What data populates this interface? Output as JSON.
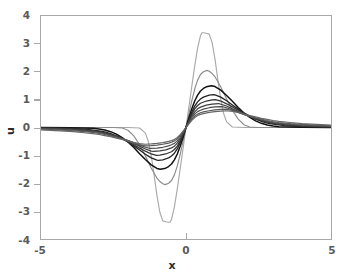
{
  "chart_data": {
    "type": "line",
    "title": "",
    "xlabel": "x",
    "ylabel": "u",
    "xlim": [
      -5,
      5
    ],
    "ylim": [
      -4,
      4
    ],
    "xticks": [
      -5,
      0,
      5
    ],
    "xticklabels": [
      "-5",
      "0",
      "5"
    ],
    "yticks": [
      -4,
      -3,
      -2,
      -1,
      0,
      1,
      2,
      3,
      4
    ],
    "yticklabels": [
      "-4",
      "-3",
      "-2",
      "-1",
      "0",
      "1",
      "2",
      "3",
      "4"
    ],
    "grid": false,
    "legend": false,
    "series": [
      {
        "name": "curve-1",
        "color": "#a9a9a9",
        "amplitude": 3.4,
        "peak_x": 0.55,
        "trough_x": -0.55,
        "half_width": 0.42,
        "support": 1.35,
        "linewidth": 1.15,
        "x": [
          -5.0,
          -4.5,
          -4.0,
          -3.5,
          -3.0,
          -2.5,
          -2.0,
          -1.6,
          -1.4,
          -1.3,
          -1.2,
          -1.1,
          -1.0,
          -0.9,
          -0.8,
          -0.7,
          -0.6,
          -0.55,
          -0.5,
          -0.4,
          -0.3,
          -0.2,
          -0.1,
          0.0,
          0.1,
          0.2,
          0.3,
          0.4,
          0.5,
          0.55,
          0.6,
          0.7,
          0.8,
          0.9,
          1.0,
          1.1,
          1.2,
          1.3,
          1.4,
          1.6,
          2.0,
          2.5,
          3.0,
          3.5,
          4.0,
          4.5,
          5.0
        ],
        "y": [
          0.0,
          0.0,
          0.0,
          0.0,
          0.0,
          0.0,
          0.0,
          -0.02,
          -0.2,
          -0.5,
          -1.0,
          -1.7,
          -2.45,
          -3.05,
          -3.35,
          -3.38,
          -3.4,
          -3.4,
          -3.3,
          -2.85,
          -2.2,
          -1.48,
          -0.74,
          0.0,
          0.74,
          1.48,
          2.2,
          2.85,
          3.3,
          3.4,
          3.4,
          3.38,
          3.35,
          3.05,
          2.45,
          1.7,
          1.0,
          0.5,
          0.2,
          0.02,
          0.0,
          0.0,
          0.0,
          0.0,
          0.0,
          0.0,
          0.0
        ]
      },
      {
        "name": "curve-2",
        "color": "#8c8c8c",
        "amplitude": 2.05,
        "peak_x": 0.72,
        "trough_x": -0.72,
        "half_width": 0.6,
        "support": 1.8,
        "linewidth": 1.15,
        "x": [
          -5.0,
          -4.0,
          -3.0,
          -2.5,
          -2.2,
          -2.0,
          -1.8,
          -1.6,
          -1.4,
          -1.2,
          -1.0,
          -0.9,
          -0.8,
          -0.72,
          -0.6,
          -0.5,
          -0.4,
          -0.3,
          -0.2,
          -0.1,
          0.0,
          0.1,
          0.2,
          0.3,
          0.4,
          0.5,
          0.6,
          0.72,
          0.8,
          0.9,
          1.0,
          1.2,
          1.4,
          1.6,
          1.8,
          2.0,
          2.2,
          2.5,
          3.0,
          4.0,
          5.0
        ],
        "y": [
          0.0,
          0.0,
          0.0,
          0.0,
          -0.02,
          -0.1,
          -0.3,
          -0.62,
          -1.02,
          -1.45,
          -1.82,
          -1.94,
          -2.02,
          -2.05,
          -2.0,
          -1.9,
          -1.7,
          -1.38,
          -0.96,
          -0.49,
          0.0,
          0.49,
          0.96,
          1.38,
          1.7,
          1.9,
          2.0,
          2.05,
          2.02,
          1.94,
          1.82,
          1.45,
          1.02,
          0.62,
          0.3,
          0.1,
          0.02,
          0.0,
          0.0,
          0.0,
          0.0
        ]
      },
      {
        "name": "curve-3",
        "color": "#111111",
        "amplitude": 1.5,
        "peak_x": 0.88,
        "trough_x": -0.88,
        "half_width": 0.78,
        "support": 2.4,
        "linewidth": 1.5,
        "x": [
          -5.0,
          -4.0,
          -3.2,
          -3.0,
          -2.8,
          -2.6,
          -2.4,
          -2.2,
          -2.0,
          -1.8,
          -1.6,
          -1.4,
          -1.2,
          -1.0,
          -0.88,
          -0.7,
          -0.6,
          -0.5,
          -0.4,
          -0.3,
          -0.2,
          -0.1,
          0.0,
          0.1,
          0.2,
          0.3,
          0.4,
          0.5,
          0.6,
          0.7,
          0.88,
          1.0,
          1.2,
          1.4,
          1.6,
          1.8,
          2.0,
          2.2,
          2.4,
          2.6,
          2.8,
          3.0,
          3.2,
          4.0,
          5.0
        ],
        "y": [
          0.0,
          -0.01,
          -0.03,
          -0.05,
          -0.09,
          -0.15,
          -0.24,
          -0.36,
          -0.52,
          -0.72,
          -0.94,
          -1.15,
          -1.34,
          -1.47,
          -1.5,
          -1.46,
          -1.4,
          -1.31,
          -1.16,
          -0.95,
          -0.67,
          -0.35,
          0.0,
          0.35,
          0.67,
          0.95,
          1.16,
          1.31,
          1.4,
          1.46,
          1.5,
          1.47,
          1.34,
          1.15,
          0.94,
          0.72,
          0.52,
          0.36,
          0.24,
          0.15,
          0.09,
          0.05,
          0.03,
          0.01,
          0.0
        ]
      },
      {
        "name": "curve-4",
        "color": "#242424",
        "amplitude": 1.18,
        "peak_x": 0.95,
        "trough_x": -0.95,
        "half_width": 0.92,
        "support": 2.9,
        "linewidth": 1.35,
        "x": [
          -5.0,
          -4.2,
          -3.8,
          -3.4,
          -3.0,
          -2.8,
          -2.6,
          -2.4,
          -2.2,
          -2.0,
          -1.8,
          -1.6,
          -1.4,
          -1.2,
          -1.0,
          -0.95,
          -0.8,
          -0.6,
          -0.5,
          -0.4,
          -0.3,
          -0.2,
          -0.1,
          0.0,
          0.1,
          0.2,
          0.3,
          0.4,
          0.5,
          0.6,
          0.8,
          0.95,
          1.0,
          1.2,
          1.4,
          1.6,
          1.8,
          2.0,
          2.2,
          2.4,
          2.6,
          2.8,
          3.0,
          3.4,
          3.8,
          4.2,
          5.0
        ],
        "y": [
          -0.01,
          -0.02,
          -0.04,
          -0.07,
          -0.12,
          -0.16,
          -0.22,
          -0.3,
          -0.4,
          -0.52,
          -0.66,
          -0.81,
          -0.96,
          -1.09,
          -1.17,
          -1.18,
          -1.16,
          -1.09,
          -1.02,
          -0.92,
          -0.77,
          -0.55,
          -0.29,
          0.0,
          0.29,
          0.55,
          0.77,
          0.92,
          1.02,
          1.09,
          1.16,
          1.18,
          1.17,
          1.09,
          0.96,
          0.81,
          0.66,
          0.52,
          0.4,
          0.3,
          0.22,
          0.16,
          0.12,
          0.07,
          0.04,
          0.02,
          0.01
        ]
      },
      {
        "name": "curve-5",
        "color": "#333333",
        "amplitude": 1.0,
        "peak_x": 1.02,
        "trough_x": -1.02,
        "half_width": 1.05,
        "support": 3.4,
        "linewidth": 1.3,
        "x": [
          -5.0,
          -4.5,
          -4.0,
          -3.6,
          -3.2,
          -3.0,
          -2.8,
          -2.6,
          -2.4,
          -2.2,
          -2.0,
          -1.8,
          -1.6,
          -1.4,
          -1.2,
          -1.02,
          -0.9,
          -0.7,
          -0.5,
          -0.4,
          -0.3,
          -0.2,
          -0.1,
          0.0,
          0.1,
          0.2,
          0.3,
          0.4,
          0.5,
          0.7,
          0.9,
          1.02,
          1.2,
          1.4,
          1.6,
          1.8,
          2.0,
          2.2,
          2.4,
          2.6,
          2.8,
          3.0,
          3.2,
          3.6,
          4.0,
          4.5,
          5.0
        ],
        "y": [
          -0.02,
          -0.03,
          -0.05,
          -0.08,
          -0.12,
          -0.15,
          -0.19,
          -0.25,
          -0.32,
          -0.41,
          -0.51,
          -0.62,
          -0.74,
          -0.85,
          -0.95,
          -1.0,
          -0.99,
          -0.95,
          -0.87,
          -0.79,
          -0.67,
          -0.48,
          -0.25,
          0.0,
          0.25,
          0.48,
          0.67,
          0.79,
          0.87,
          0.95,
          0.99,
          1.0,
          0.95,
          0.85,
          0.74,
          0.62,
          0.51,
          0.41,
          0.32,
          0.25,
          0.19,
          0.15,
          0.12,
          0.08,
          0.05,
          0.03,
          0.02
        ]
      },
      {
        "name": "curve-6",
        "color": "#3f3f3f",
        "amplitude": 0.86,
        "peak_x": 1.12,
        "trough_x": -1.12,
        "half_width": 1.2,
        "support": 3.9,
        "linewidth": 1.25,
        "x": [
          -5.0,
          -4.5,
          -4.0,
          -3.6,
          -3.2,
          -3.0,
          -2.8,
          -2.6,
          -2.4,
          -2.2,
          -2.0,
          -1.8,
          -1.6,
          -1.4,
          -1.2,
          -1.12,
          -0.9,
          -0.7,
          -0.5,
          -0.4,
          -0.3,
          -0.2,
          -0.1,
          0.0,
          0.1,
          0.2,
          0.3,
          0.4,
          0.5,
          0.7,
          0.9,
          1.12,
          1.4,
          1.6,
          1.8,
          2.0,
          2.2,
          2.4,
          2.6,
          2.8,
          3.0,
          3.2,
          3.6,
          4.0,
          4.5,
          5.0
        ],
        "y": [
          -0.03,
          -0.04,
          -0.06,
          -0.09,
          -0.13,
          -0.16,
          -0.2,
          -0.26,
          -0.32,
          -0.4,
          -0.48,
          -0.58,
          -0.67,
          -0.77,
          -0.85,
          -0.86,
          -0.84,
          -0.8,
          -0.73,
          -0.67,
          -0.56,
          -0.41,
          -0.21,
          0.0,
          0.21,
          0.41,
          0.56,
          0.67,
          0.73,
          0.8,
          0.84,
          0.86,
          0.77,
          0.67,
          0.58,
          0.48,
          0.4,
          0.32,
          0.26,
          0.2,
          0.16,
          0.13,
          0.09,
          0.06,
          0.04,
          0.03
        ]
      },
      {
        "name": "curve-7",
        "color": "#4d4d4d",
        "amplitude": 0.75,
        "peak_x": 1.25,
        "trough_x": -1.25,
        "half_width": 1.38,
        "support": 4.4,
        "linewidth": 1.2,
        "x": [
          -5.0,
          -4.5,
          -4.0,
          -3.6,
          -3.2,
          -3.0,
          -2.8,
          -2.6,
          -2.4,
          -2.2,
          -2.0,
          -1.8,
          -1.6,
          -1.4,
          -1.25,
          -1.0,
          -0.8,
          -0.6,
          -0.5,
          -0.4,
          -0.3,
          -0.2,
          -0.1,
          0.0,
          0.1,
          0.2,
          0.3,
          0.4,
          0.5,
          0.6,
          0.8,
          1.0,
          1.25,
          1.4,
          1.6,
          1.8,
          2.0,
          2.2,
          2.4,
          2.6,
          2.8,
          3.0,
          3.2,
          3.6,
          4.0,
          4.5,
          5.0
        ],
        "y": [
          -0.04,
          -0.06,
          -0.08,
          -0.11,
          -0.15,
          -0.18,
          -0.22,
          -0.27,
          -0.33,
          -0.4,
          -0.47,
          -0.55,
          -0.63,
          -0.71,
          -0.75,
          -0.74,
          -0.71,
          -0.66,
          -0.62,
          -0.57,
          -0.48,
          -0.35,
          -0.18,
          0.0,
          0.18,
          0.35,
          0.48,
          0.57,
          0.62,
          0.66,
          0.71,
          0.74,
          0.75,
          0.71,
          0.63,
          0.55,
          0.47,
          0.4,
          0.33,
          0.27,
          0.22,
          0.18,
          0.15,
          0.11,
          0.08,
          0.06,
          0.04
        ]
      },
      {
        "name": "curve-8",
        "color": "#595959",
        "amplitude": 0.66,
        "peak_x": 1.4,
        "trough_x": -1.4,
        "half_width": 1.58,
        "support": 5.0,
        "linewidth": 1.2,
        "x": [
          -5.0,
          -4.5,
          -4.0,
          -3.6,
          -3.2,
          -3.0,
          -2.8,
          -2.6,
          -2.4,
          -2.2,
          -2.0,
          -1.8,
          -1.6,
          -1.4,
          -1.2,
          -1.0,
          -0.8,
          -0.6,
          -0.5,
          -0.4,
          -0.3,
          -0.2,
          -0.1,
          0.0,
          0.1,
          0.2,
          0.3,
          0.4,
          0.5,
          0.6,
          0.8,
          1.0,
          1.2,
          1.4,
          1.6,
          1.8,
          2.0,
          2.2,
          2.4,
          2.6,
          2.8,
          3.0,
          3.2,
          3.6,
          4.0,
          4.5,
          5.0
        ],
        "y": [
          -0.06,
          -0.08,
          -0.11,
          -0.14,
          -0.18,
          -0.21,
          -0.25,
          -0.3,
          -0.35,
          -0.41,
          -0.47,
          -0.54,
          -0.61,
          -0.66,
          -0.65,
          -0.63,
          -0.6,
          -0.56,
          -0.53,
          -0.48,
          -0.41,
          -0.3,
          -0.15,
          0.0,
          0.15,
          0.3,
          0.41,
          0.48,
          0.53,
          0.56,
          0.6,
          0.63,
          0.65,
          0.66,
          0.61,
          0.54,
          0.47,
          0.41,
          0.35,
          0.3,
          0.25,
          0.21,
          0.18,
          0.14,
          0.11,
          0.08,
          0.06
        ]
      },
      {
        "name": "curve-9",
        "color": "#666666",
        "amplitude": 0.6,
        "peak_x": 1.6,
        "trough_x": -1.6,
        "half_width": 1.8,
        "support": 5.0,
        "linewidth": 1.2,
        "x": [
          -5.0,
          -4.5,
          -4.0,
          -3.6,
          -3.2,
          -3.0,
          -2.8,
          -2.6,
          -2.4,
          -2.2,
          -2.0,
          -1.8,
          -1.6,
          -1.4,
          -1.2,
          -1.0,
          -0.8,
          -0.6,
          -0.5,
          -0.4,
          -0.3,
          -0.2,
          -0.1,
          0.0,
          0.1,
          0.2,
          0.3,
          0.4,
          0.5,
          0.6,
          0.8,
          1.0,
          1.2,
          1.4,
          1.6,
          1.8,
          2.0,
          2.2,
          2.4,
          2.6,
          2.8,
          3.0,
          3.2,
          3.6,
          4.0,
          4.5,
          5.0
        ],
        "y": [
          -0.09,
          -0.11,
          -0.14,
          -0.18,
          -0.22,
          -0.25,
          -0.29,
          -0.33,
          -0.38,
          -0.43,
          -0.48,
          -0.54,
          -0.58,
          -0.6,
          -0.59,
          -0.57,
          -0.54,
          -0.5,
          -0.47,
          -0.43,
          -0.36,
          -0.26,
          -0.13,
          0.0,
          0.13,
          0.26,
          0.36,
          0.43,
          0.47,
          0.5,
          0.54,
          0.57,
          0.59,
          0.6,
          0.58,
          0.54,
          0.48,
          0.43,
          0.38,
          0.33,
          0.29,
          0.25,
          0.22,
          0.18,
          0.14,
          0.11,
          0.09
        ]
      }
    ]
  },
  "style": {
    "frame_color": "#a8a8a8",
    "tick_label_color": "#5a5a5a",
    "axis_label_color": "#2b2b2b",
    "background": "#ffffff"
  }
}
